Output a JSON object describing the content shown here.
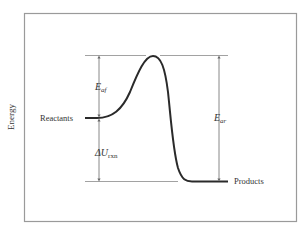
{
  "diagram": {
    "type": "energy-profile",
    "y_axis_label": "Energy",
    "reactants_label": "Reactants",
    "products_label": "Products",
    "activation_forward": {
      "symbol": "E",
      "subscript": "af"
    },
    "activation_reverse": {
      "symbol": "E",
      "subscript": "ar"
    },
    "reaction_energy": {
      "symbol": "ΔU",
      "subscript": "rxn"
    },
    "colors": {
      "curve": "#2a2a2a",
      "guide_lines": "#8a8a8a",
      "frame": "#9a9a9a",
      "text": "#333333"
    }
  }
}
